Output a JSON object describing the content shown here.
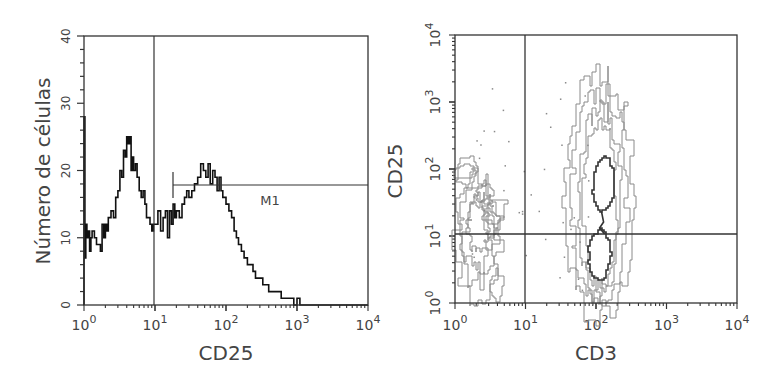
{
  "chart_data": [
    {
      "type": "line",
      "subtype": "histogram",
      "title": "",
      "xlabel": "CD25",
      "ylabel": "Número de células",
      "xscale": "log",
      "xlim": [
        1,
        10000
      ],
      "ylim": [
        0,
        40
      ],
      "xticks": [
        {
          "base": "10",
          "exp": "0"
        },
        {
          "base": "10",
          "exp": "1"
        },
        {
          "base": "10",
          "exp": "2"
        },
        {
          "base": "10",
          "exp": "3"
        },
        {
          "base": "10",
          "exp": "4"
        }
      ],
      "yticks": [
        "0",
        "10",
        "20",
        "30",
        "40"
      ],
      "grid": false,
      "gate_line_x": 10,
      "marker": {
        "label": "M1",
        "x_start": 18,
        "x_end": 10000,
        "y": 18
      },
      "x": [
        1.0,
        1.03,
        1.06,
        1.1,
        1.15,
        1.2,
        1.25,
        1.3,
        1.4,
        1.5,
        1.6,
        1.7,
        1.8,
        1.9,
        2.0,
        2.1,
        2.2,
        2.4,
        2.6,
        2.8,
        3.0,
        3.2,
        3.4,
        3.6,
        3.8,
        4.0,
        4.2,
        4.4,
        4.6,
        4.8,
        5.0,
        5.3,
        5.6,
        6.0,
        6.4,
        6.8,
        7.2,
        7.6,
        8.0,
        8.5,
        9.0,
        9.5,
        10,
        11,
        12,
        13,
        14,
        15,
        16,
        17,
        18,
        19,
        20,
        22,
        24,
        26,
        28,
        30,
        33,
        36,
        40,
        44,
        48,
        52,
        56,
        60,
        65,
        70,
        75,
        80,
        85,
        90,
        95,
        100,
        110,
        120,
        130,
        140,
        150,
        165,
        180,
        200,
        220,
        240,
        260,
        280,
        300,
        330,
        360,
        400,
        450,
        500,
        550,
        600,
        700,
        800,
        900,
        1000,
        1100,
        1200,
        1300,
        1500,
        2000,
        4000,
        10000
      ],
      "values": [
        28,
        7,
        12,
        10,
        11,
        8,
        10,
        11,
        10,
        9,
        9,
        8,
        12,
        10,
        12,
        11,
        13,
        14,
        13,
        16,
        17,
        20,
        19,
        23,
        22,
        25,
        24,
        25,
        20,
        22,
        20,
        21,
        19,
        17,
        16,
        17,
        15,
        13,
        13,
        12,
        11,
        12,
        12,
        14,
        11,
        13,
        14,
        10,
        14,
        12,
        15,
        13,
        14,
        13,
        15,
        16,
        17,
        16,
        17,
        18,
        19,
        21,
        20,
        19,
        21,
        18,
        20,
        19,
        17,
        19,
        17,
        16,
        16,
        15,
        14,
        13,
        11,
        10,
        9,
        8,
        7,
        6,
        6,
        5,
        4,
        4,
        4,
        3,
        3,
        2,
        2,
        2,
        2,
        1,
        1,
        1,
        0,
        1,
        0,
        0,
        0,
        0,
        0,
        0
      ]
    },
    {
      "type": "contour",
      "subtype": "flow-cytometry-density-plot",
      "title": "",
      "xlabel": "CD3",
      "ylabel": "CD25",
      "xscale": "log",
      "yscale": "log",
      "xlim": [
        1,
        10000
      ],
      "ylim": [
        1,
        10000
      ],
      "xticks": [
        {
          "base": "10",
          "exp": "0"
        },
        {
          "base": "10",
          "exp": "1"
        },
        {
          "base": "10",
          "exp": "2"
        },
        {
          "base": "10",
          "exp": "3"
        },
        {
          "base": "10",
          "exp": "4"
        }
      ],
      "yticks": [
        {
          "base": "10",
          "exp": "0"
        },
        {
          "base": "10",
          "exp": "1"
        },
        {
          "base": "10",
          "exp": "2"
        },
        {
          "base": "10",
          "exp": "3"
        },
        {
          "base": "10",
          "exp": "4"
        }
      ],
      "grid": false,
      "quadrant_gate": {
        "x": 10,
        "y": 11
      },
      "populations": [
        {
          "name": "CD3-negative cluster",
          "x_range": [
            1,
            8
          ],
          "y_range": [
            1,
            150
          ],
          "density": "medium"
        },
        {
          "name": "CD3-positive cluster (outer)",
          "x_range": [
            40,
            280
          ],
          "y_range": [
            1,
            1200
          ],
          "density": "low"
        },
        {
          "name": "CD3-positive CD25-high core",
          "x_center": 120,
          "y_range": [
            18,
            110
          ],
          "density": "high"
        },
        {
          "name": "CD3-positive CD25-low core",
          "x_center": 110,
          "y_range": [
            3,
            10
          ],
          "density": "high"
        }
      ]
    }
  ],
  "left_panel": {
    "ylabel": "Número de células",
    "xlabel": "CD25",
    "marker_label": "M1",
    "ytick_labels": [
      "0",
      "10",
      "20",
      "30",
      "40"
    ]
  },
  "right_panel": {
    "ylabel": "CD25",
    "xlabel": "CD3"
  },
  "colors": {
    "axis": "#333333",
    "histogram": "#111111",
    "contour_outer": "#8a8a8a",
    "contour_inner": "#333333",
    "text": "#444444"
  }
}
